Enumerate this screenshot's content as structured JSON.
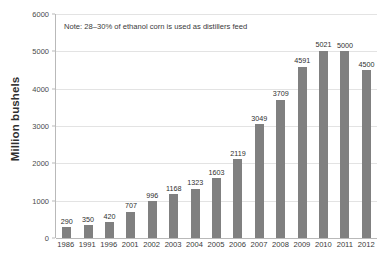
{
  "chart_data": {
    "type": "bar",
    "title": "",
    "subtitle": "",
    "xlabel": "",
    "ylabel": "Million bushels",
    "ylim": [
      0,
      6000
    ],
    "yticks": [
      0,
      1000,
      2000,
      3000,
      4000,
      5000,
      6000
    ],
    "ytick_labels": [
      "0",
      "1000",
      "2000",
      "3000",
      "4000",
      "5000",
      "6000"
    ],
    "grid": true,
    "legend": null,
    "bar_color": "#808080",
    "annotations": [
      {
        "name": "distillers-feed-note",
        "text": "Note: 28–30% of ethanol corn is used as distillers feed"
      }
    ],
    "categories": [
      "1986",
      "1991",
      "1996",
      "2001",
      "2002",
      "2003",
      "2004",
      "2005",
      "2006",
      "2007",
      "2008",
      "2009",
      "2010",
      "2011",
      "2012"
    ],
    "values": [
      290,
      350,
      420,
      707,
      996,
      1168,
      1323,
      1603,
      2119,
      3049,
      3709,
      4591,
      5021,
      5000,
      4500
    ],
    "data_labels": [
      "290",
      "350",
      "420",
      "707",
      "996",
      "1168",
      "1323",
      "1603",
      "2119",
      "3049",
      "3709",
      "4591",
      "5021",
      "5000",
      "4500"
    ]
  }
}
